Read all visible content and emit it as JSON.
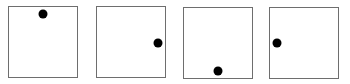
{
  "diagram": {
    "border_color": "#6e6e6e",
    "dot_color": "#000000",
    "panels": [
      {
        "id": 1,
        "box": {
          "x": 8,
          "y": 6,
          "w": 70,
          "h": 72
        },
        "dot_position": "top",
        "dot": {
          "cx": 43,
          "cy": 14
        }
      },
      {
        "id": 2,
        "box": {
          "x": 96,
          "y": 6,
          "w": 70,
          "h": 72
        },
        "dot_position": "right",
        "dot": {
          "cx": 158,
          "cy": 43
        }
      },
      {
        "id": 3,
        "box": {
          "x": 183,
          "y": 7,
          "w": 70,
          "h": 72
        },
        "dot_position": "bottom",
        "dot": {
          "cx": 218,
          "cy": 71
        }
      },
      {
        "id": 4,
        "box": {
          "x": 269,
          "y": 7,
          "w": 70,
          "h": 72
        },
        "dot_position": "left",
        "dot": {
          "cx": 277,
          "cy": 43
        }
      }
    ]
  }
}
